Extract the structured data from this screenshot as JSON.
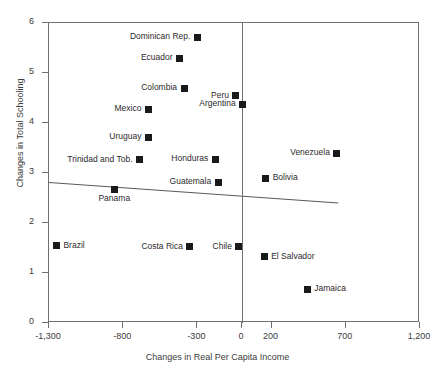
{
  "chart_data": {
    "type": "scatter",
    "title": "",
    "xlabel": "Changes in Real Per Capita Income",
    "ylabel": "Changes in Total Schooling",
    "xlim": [
      -1300,
      1200
    ],
    "ylim": [
      0,
      6
    ],
    "xticks": [
      -1300,
      -800,
      -300,
      0,
      200,
      700,
      1200
    ],
    "xtick_labels": [
      "-1,300",
      "-800",
      "-300",
      "0",
      "200",
      "700",
      "1,200"
    ],
    "yticks": [
      0,
      1,
      2,
      3,
      4,
      5,
      6
    ],
    "ytick_labels": [
      "0",
      "1",
      "2",
      "3",
      "4",
      "5",
      "6"
    ],
    "grid": false,
    "legend": "none",
    "reference_line_x": 0,
    "trendline": {
      "label": "linear fit",
      "x_start": -1300,
      "y_start": 2.82,
      "x_end": 646,
      "y_end": 2.41
    },
    "points": [
      {
        "label": "Dominican Rep.",
        "x": -300,
        "y": 5.72,
        "label_pos": "left"
      },
      {
        "label": "Ecuador",
        "x": -420,
        "y": 5.3,
        "label_pos": "left"
      },
      {
        "label": "Colombia",
        "x": -390,
        "y": 4.7,
        "label_pos": "left"
      },
      {
        "label": "Peru",
        "x": -40,
        "y": 4.55,
        "label_pos": "left"
      },
      {
        "label": "Argentina",
        "x": 5,
        "y": 4.38,
        "label_pos": "left"
      },
      {
        "label": "Mexico",
        "x": -630,
        "y": 4.28,
        "label_pos": "left"
      },
      {
        "label": "Uruguay",
        "x": -630,
        "y": 3.72,
        "label_pos": "left"
      },
      {
        "label": "Venezuela",
        "x": 640,
        "y": 3.4,
        "label_pos": "left"
      },
      {
        "label": "Trinidad and Tob.",
        "x": -690,
        "y": 3.27,
        "label_pos": "left"
      },
      {
        "label": "Honduras",
        "x": -180,
        "y": 3.28,
        "label_pos": "left"
      },
      {
        "label": "Bolivia",
        "x": 160,
        "y": 2.9,
        "label_pos": "right"
      },
      {
        "label": "Guatemala",
        "x": -160,
        "y": 2.82,
        "label_pos": "left"
      },
      {
        "label": "Panama",
        "x": -860,
        "y": 2.68,
        "label_pos": "below"
      },
      {
        "label": "Brazil",
        "x": -1250,
        "y": 1.55,
        "label_pos": "right"
      },
      {
        "label": "Costa Rica",
        "x": -350,
        "y": 1.53,
        "label_pos": "left"
      },
      {
        "label": "Chile",
        "x": -20,
        "y": 1.53,
        "label_pos": "left"
      },
      {
        "label": "El Salvador",
        "x": 150,
        "y": 1.33,
        "label_pos": "right"
      },
      {
        "label": "Jamaica",
        "x": 440,
        "y": 0.68,
        "label_pos": "right"
      }
    ]
  },
  "colors": {
    "marker": "#1a1a1a",
    "axis": "#6f6f6f",
    "text": "#3b3b3b",
    "trendline": "#5a5a5a"
  }
}
